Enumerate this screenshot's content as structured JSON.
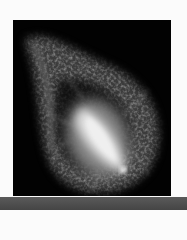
{
  "image": {
    "subject": "fluorescence micrograph of a cell with bright spindle",
    "background_color": "#020202",
    "glow_color": "#e8e8e8",
    "halo_color": "#6a6a6a"
  },
  "bottom_bar": {
    "color": "#4f4f4f"
  }
}
